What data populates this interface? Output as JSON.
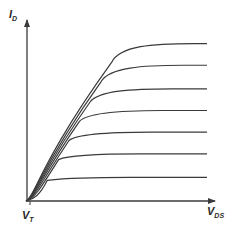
{
  "chart_data": {
    "type": "line",
    "title": "",
    "xlabel": "V_DS",
    "ylabel": "I_D",
    "x_tick_labels": [
      "V_T"
    ],
    "grid": false,
    "legend": null,
    "xlim": [
      0,
      1
    ],
    "ylim": [
      0,
      1
    ],
    "series": [
      {
        "name": "curve-1",
        "saturation_level": 0.13
      },
      {
        "name": "curve-2",
        "saturation_level": 0.26
      },
      {
        "name": "curve-3",
        "saturation_level": 0.38
      },
      {
        "name": "curve-4",
        "saturation_level": 0.5
      },
      {
        "name": "curve-5",
        "saturation_level": 0.62
      },
      {
        "name": "curve-6",
        "saturation_level": 0.75
      },
      {
        "name": "curve-7",
        "saturation_level": 0.87
      }
    ],
    "line_color": "#3a3a3a",
    "axis_color": "#3a3a3a"
  },
  "labels": {
    "y_main": "I",
    "y_sub": "D",
    "x_main": "V",
    "x_sub": "DS",
    "tick_main": "V",
    "tick_sub": "T"
  }
}
